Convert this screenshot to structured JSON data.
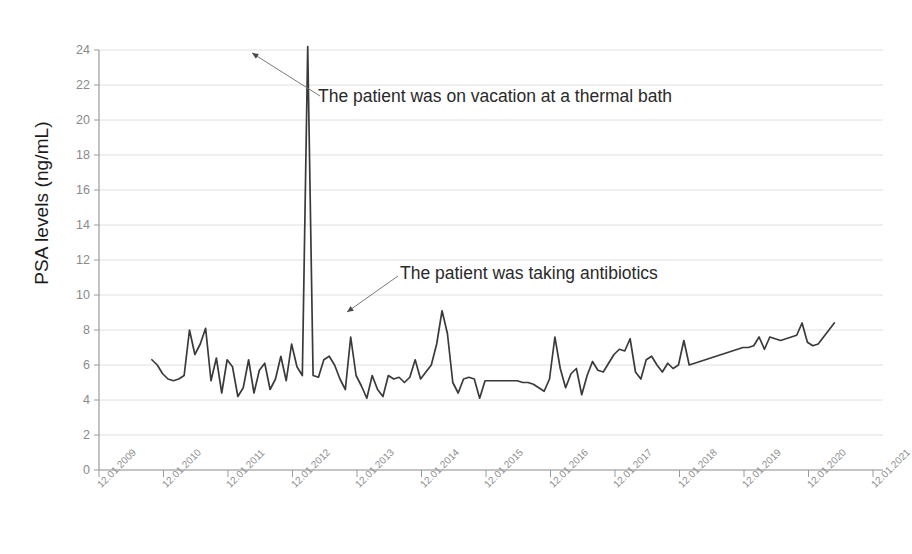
{
  "chart_data": {
    "type": "line",
    "title": "",
    "xlabel": "",
    "ylabel": "PSA levels (ng/mL)",
    "ylim": [
      0,
      24
    ],
    "ytick_step": 2,
    "yticks": [
      0,
      2,
      4,
      6,
      8,
      10,
      12,
      14,
      16,
      18,
      20,
      22,
      24
    ],
    "xticks": [
      "12.01.2009",
      "12.01.2010",
      "12.01.2011",
      "12.01.2012",
      "12.01.2013",
      "12.01.2014",
      "12.01.2015",
      "12.01.2016",
      "12.01.2017",
      "12.01.2018",
      "12.01.2019",
      "12.01.2020",
      "12.01.2021"
    ],
    "xlim": [
      "12.01.2009",
      "12.01.2021"
    ],
    "grid": true,
    "grid_axis": "y",
    "legend": "none",
    "series": [
      {
        "name": "PSA level",
        "color": "#3a3a3a",
        "x_start_year": 2009.82,
        "x_end_year": 2020.4,
        "values": [
          6.3,
          6.0,
          5.5,
          5.2,
          5.1,
          5.2,
          5.4,
          8.0,
          6.6,
          7.2,
          8.1,
          5.1,
          6.4,
          4.4,
          6.3,
          5.9,
          4.2,
          4.7,
          6.3,
          4.4,
          5.7,
          6.1,
          4.6,
          5.2,
          6.5,
          5.1,
          7.2,
          5.9,
          5.4,
          24.2,
          5.4,
          5.3,
          6.3,
          6.5,
          6.0,
          5.2,
          4.6,
          7.6,
          5.4,
          4.8,
          4.1,
          5.4,
          4.6,
          4.2,
          5.4,
          5.2,
          5.3,
          5.0,
          5.3,
          6.3,
          5.2,
          5.6,
          6.0,
          7.2,
          9.1,
          7.8,
          5.0,
          4.4,
          5.2,
          5.3,
          5.2,
          4.1,
          5.1,
          5.1,
          5.1,
          5.1,
          5.1,
          5.1,
          5.1,
          5.0,
          5.0,
          4.9,
          4.7,
          4.5,
          5.2,
          7.6,
          5.8,
          4.7,
          5.5,
          5.8,
          4.3,
          5.4,
          6.2,
          5.7,
          5.6,
          6.1,
          6.6,
          6.9,
          6.8,
          7.5,
          5.6,
          5.2,
          6.3,
          6.5,
          6.0,
          5.6,
          6.1,
          5.8,
          6.0,
          7.4,
          6.0,
          6.1,
          6.2,
          6.3,
          6.4,
          6.5,
          6.6,
          6.7,
          6.8,
          6.9,
          7.0,
          7.0,
          7.1,
          7.6,
          6.9,
          7.6,
          7.5,
          7.4,
          7.5,
          7.6,
          7.7,
          8.4,
          7.3,
          7.1,
          7.2,
          7.6,
          8.0,
          8.4
        ]
      }
    ],
    "annotations": [
      {
        "id": "vacation-annotation",
        "text": "The patient was on vacation at a thermal bath",
        "text_x": 318,
        "text_y": 86,
        "leader_from": [
          320,
          96
        ],
        "leader_to": [
          252,
          53
        ]
      },
      {
        "id": "antibiotics-annotation",
        "text": "The patient was taking antibiotics",
        "text_x": 400,
        "text_y": 263,
        "leader_from": [
          398,
          276
        ],
        "leader_to": [
          347,
          312
        ]
      }
    ]
  },
  "axis": {
    "y_title": "PSA levels (ng/mL)"
  },
  "colors": {
    "line": "#3a3a3a",
    "grid": "#dcdcdc",
    "axis": "#9a9a9a",
    "tick_label": "#8a8a8a",
    "annotation_text": "#2a2a2a"
  }
}
